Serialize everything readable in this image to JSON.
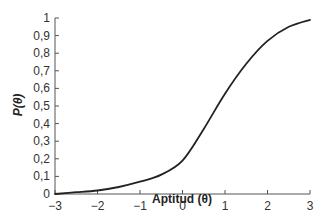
{
  "chart_data": {
    "type": "line",
    "title": "",
    "xlabel": "Aptitud (θ)",
    "ylabel": "P(θ)",
    "xlim": [
      -3,
      3
    ],
    "ylim": [
      0,
      1
    ],
    "grid": false,
    "legend": null,
    "x_ticks": [
      "−3",
      "−2",
      "−1",
      "0",
      "1",
      "2",
      "3"
    ],
    "y_ticks": [
      "0",
      "0,1",
      "0,2",
      "0,3",
      "0,4",
      "0,5",
      "0,6",
      "0,7",
      "0,8",
      "0,9",
      "1"
    ],
    "series": [
      {
        "name": "P(θ)",
        "color": "#222222",
        "x": [
          -3,
          -2.5,
          -2,
          -1.5,
          -1,
          -0.5,
          0,
          0.5,
          1,
          1.5,
          2,
          2.5,
          3
        ],
        "y": [
          0.0,
          0.01,
          0.02,
          0.04,
          0.07,
          0.11,
          0.19,
          0.37,
          0.57,
          0.74,
          0.87,
          0.95,
          0.99
        ]
      }
    ]
  }
}
